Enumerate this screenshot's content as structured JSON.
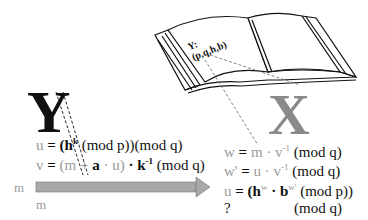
{
  "diagram": {
    "signer_label": "Y",
    "verifier_label": "X",
    "public_key_book": {
      "line1": "Y:",
      "line2": "(p,q,h,b)"
    },
    "signer_equations": [
      {
        "lhs": "u",
        "eq": " = ",
        "rhs_open": "(",
        "base": "h",
        "exp": "k",
        "rest": " (mod p))(mod q)"
      },
      {
        "lhs": "v",
        "eq": " = ",
        "part1": "(m + ",
        "a": "a",
        "part2": " · u)",
        "dot": " · ",
        "k": "k",
        "exp": "-1",
        "rest": " (mod q)"
      }
    ],
    "message_arrow": {
      "from_label": "m",
      "below_label": "m",
      "color": "#a0a0a0"
    },
    "verifier_equations": [
      {
        "lhs": "w",
        "eq": " = ",
        "m": "m",
        "dot": " · ",
        "v": "v",
        "exp": "-1",
        "rest": "  (mod q)"
      },
      {
        "lhs": "w'",
        "eq": " = ",
        "u": "u",
        "dot": " · ",
        "v": "v",
        "exp": "-1",
        "rest": "  (mod q)"
      },
      {
        "lhs": "u",
        "eq": " = ",
        "open": "(",
        "h": "h",
        "hexp": "w",
        "dot": " · ",
        "b": "b",
        "bexp": "w'",
        "rest": " (mod p))"
      },
      {
        "lhs": "?",
        "rest": "(mod q)"
      }
    ]
  }
}
